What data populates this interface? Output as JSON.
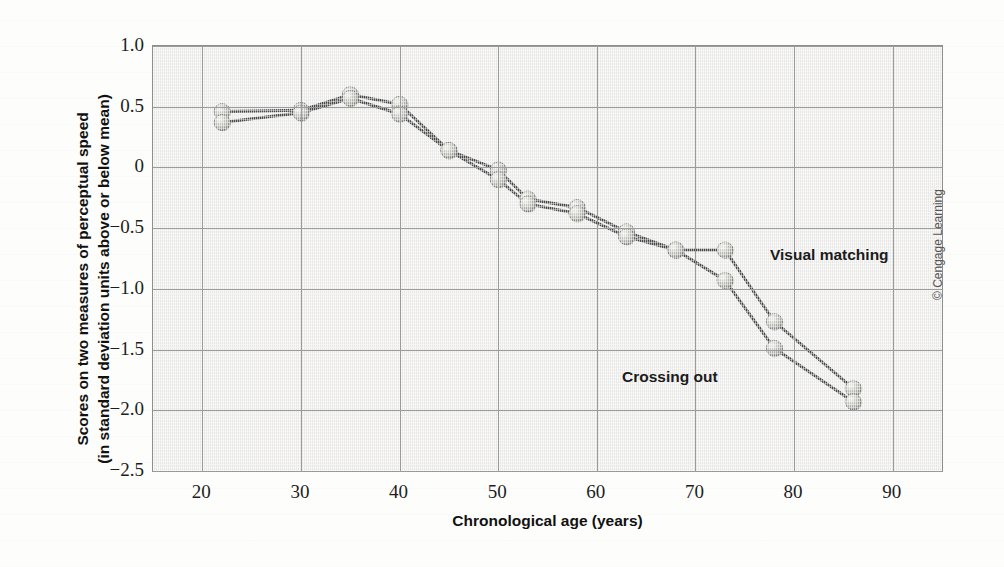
{
  "figure": {
    "credit": "© Cengage Learning"
  },
  "axes": {
    "y_title_line1": "Scores on two measures of perceptual speed",
    "y_title_line2": "(in standard deviation units above or below mean)",
    "x_title": "Chronological age (years)",
    "y_ticks": [
      "1.0",
      "0.5",
      "0",
      "−0.5",
      "−1.0",
      "−1.5",
      "−2.0",
      "−2.5"
    ],
    "x_ticks": [
      "20",
      "30",
      "40",
      "50",
      "60",
      "70",
      "80",
      "90"
    ]
  },
  "annotations": {
    "visual_matching": "Visual matching",
    "crossing_out": "Crossing out"
  },
  "style": {
    "plot_background": "#efeeec",
    "grid_color": "#9b9b9b",
    "line_color": "#4a4a4a",
    "marker_fill": "#b9b9b4",
    "marker_highlight": "#e7e7e3",
    "marker_shadow": "#7e7e79",
    "text_color": "#1d1d1d"
  },
  "chart_data": {
    "type": "line",
    "title": "",
    "xlabel": "Chronological age (years)",
    "ylabel": "Scores on two measures of perceptual speed (in standard deviation units above or below mean)",
    "xlim": [
      15,
      95
    ],
    "ylim": [
      -2.5,
      1.0
    ],
    "xticks": [
      20,
      30,
      40,
      50,
      60,
      70,
      80,
      90
    ],
    "yticks": [
      1.0,
      0.5,
      0,
      -0.5,
      -1.0,
      -1.5,
      -2.0,
      -2.5
    ],
    "grid": true,
    "legend": "inline-annotations",
    "series": [
      {
        "name": "Visual matching",
        "x": [
          22,
          30,
          35,
          40,
          45,
          50,
          53,
          58,
          63,
          68,
          73,
          78,
          86
        ],
        "y": [
          0.46,
          0.47,
          0.6,
          0.52,
          0.14,
          -0.02,
          -0.26,
          -0.33,
          -0.53,
          -0.68,
          -0.68,
          -1.27,
          -1.82
        ]
      },
      {
        "name": "Crossing out",
        "x": [
          22,
          30,
          35,
          40,
          45,
          50,
          53,
          58,
          63,
          68,
          73,
          78,
          86
        ],
        "y": [
          0.37,
          0.45,
          0.57,
          0.44,
          0.14,
          -0.1,
          -0.3,
          -0.38,
          -0.57,
          -0.68,
          -0.93,
          -1.49,
          -1.93
        ]
      }
    ]
  }
}
